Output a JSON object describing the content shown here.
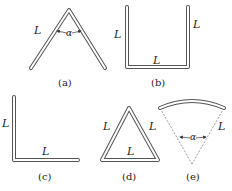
{
  "figure": {
    "panels": [
      {
        "id": "a",
        "caption": "(a)",
        "shape": "inverted-V rod",
        "labels": [
          "L",
          "α"
        ]
      },
      {
        "id": "b",
        "caption": "(b)",
        "shape": "U-shaped rod",
        "labels": [
          "L",
          "L",
          "L"
        ]
      },
      {
        "id": "c",
        "caption": "(c)",
        "shape": "L-shaped rod",
        "labels": [
          "L",
          "L"
        ]
      },
      {
        "id": "d",
        "caption": "(d)",
        "shape": "triangular rod",
        "labels": [
          "L",
          "L",
          "L"
        ]
      },
      {
        "id": "e",
        "caption": "(e)",
        "shape": "circular-arc rod",
        "labels": [
          "L",
          "α"
        ]
      }
    ],
    "colors": {
      "rod_outline": "#555555",
      "rod_fill": "#ffffff",
      "text": "#222222",
      "dashed": "#777777"
    }
  }
}
